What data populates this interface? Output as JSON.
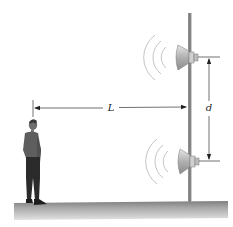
{
  "diagram": {
    "labels": {
      "distance_to_pole": "L",
      "speaker_separation": "d"
    },
    "elements": [
      {
        "name": "pole",
        "type": "vertical post"
      },
      {
        "name": "upper-speaker",
        "type": "horn loudspeaker",
        "emits": "sound waves"
      },
      {
        "name": "lower-speaker",
        "type": "horn loudspeaker",
        "emits": "sound waves"
      },
      {
        "name": "listener",
        "type": "standing person"
      },
      {
        "name": "ground",
        "type": "floor strip"
      }
    ],
    "colors": {
      "pole": "#8c8c8c",
      "speaker": "#b9b9b9",
      "wave": "#bdbdbd",
      "person_shirt": "#5e5e5e",
      "person_pants": "#2b2b2b",
      "ground_top": "#8a8a8a",
      "ground_bottom": "#dcdcdc",
      "dimension_line": "#333333"
    }
  }
}
